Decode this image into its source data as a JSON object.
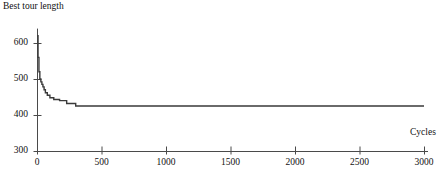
{
  "chart_data": {
    "type": "line",
    "title": "",
    "ylabel": "Best tour length",
    "xlabel": "Cycles",
    "xlim": [
      0,
      3000
    ],
    "ylim": [
      300,
      640
    ],
    "grid": false,
    "legend": null,
    "xticks": [
      0,
      500,
      1000,
      1500,
      2000,
      2500,
      3000
    ],
    "xtick_labels": [
      "0",
      "500",
      "1000",
      "1500",
      "2000",
      "2500",
      "3000"
    ],
    "yticks": [
      300,
      400,
      500,
      600
    ],
    "ytick_labels": [
      "300",
      "400",
      "500",
      "600"
    ],
    "line_color": "#3a3a3a",
    "series": [
      {
        "name": "best tour length",
        "x": [
          0,
          8,
          8,
          15,
          15,
          22,
          22,
          30,
          30,
          38,
          38,
          46,
          46,
          55,
          55,
          65,
          65,
          80,
          80,
          100,
          100,
          130,
          130,
          175,
          175,
          230,
          230,
          300,
          300,
          3000
        ],
        "y": [
          620,
          620,
          560,
          560,
          520,
          520,
          500,
          500,
          492,
          492,
          485,
          485,
          478,
          478,
          470,
          470,
          462,
          462,
          455,
          455,
          448,
          448,
          443,
          443,
          440,
          440,
          432,
          432,
          425,
          425
        ]
      }
    ]
  },
  "axis": {
    "y_title": "Best tour length",
    "x_title": "Cycles"
  }
}
